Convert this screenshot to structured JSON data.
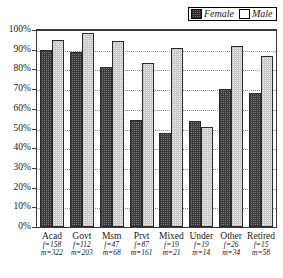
{
  "chart_data": {
    "type": "bar",
    "title": "",
    "xlabel": "",
    "ylabel": "",
    "ylim": [
      0,
      100
    ],
    "ytick_labels": [
      "100%",
      "90%",
      "80%",
      "70%",
      "60%",
      "50%",
      "40%",
      "30%",
      "20%",
      "10%",
      "0%"
    ],
    "ytick_values": [
      100,
      90,
      80,
      70,
      60,
      50,
      40,
      30,
      20,
      10,
      0
    ],
    "grid": true,
    "legend_position": "top-right",
    "categories": [
      "Acad",
      "Govt",
      "Msm",
      "Prvt",
      "Mixed",
      "Under",
      "Other",
      "Retired"
    ],
    "category_counts": [
      {
        "female": "f=158",
        "male": "m=322"
      },
      {
        "female": "f=112",
        "male": "m=203"
      },
      {
        "female": "f=47",
        "male": "m=68"
      },
      {
        "female": "f=87",
        "male": "m=161"
      },
      {
        "female": "f=19",
        "male": "m=21"
      },
      {
        "female": "f=19",
        "male": "m=14"
      },
      {
        "female": "f=26",
        "male": "m=34"
      },
      {
        "female": "f=15",
        "male": "m=58"
      }
    ],
    "series": [
      {
        "name": "Female",
        "swatch": "checkered-dark",
        "color": "#787878",
        "values": [
          90,
          89,
          81,
          54.5,
          47.5,
          54,
          70,
          68
        ]
      },
      {
        "name": "Male",
        "swatch": "dotted-light",
        "color": "#ececec",
        "values": [
          95,
          98.5,
          94.5,
          83.5,
          91,
          51,
          92,
          87
        ]
      }
    ]
  },
  "legend": {
    "female_label": "Female",
    "male_label": "Male"
  }
}
